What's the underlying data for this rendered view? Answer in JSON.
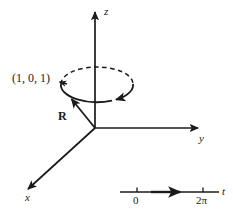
{
  "figure": {
    "background_color": "#ffffff",
    "stroke_color": "#1a1a1a",
    "axes": [
      {
        "name": "z",
        "label": "z",
        "direction": "up",
        "arrow": true
      },
      {
        "name": "y",
        "label": "y",
        "direction": "right",
        "arrow": true
      },
      {
        "name": "x",
        "label": "x",
        "direction": "down-left",
        "arrow": true
      }
    ],
    "origin": {
      "x": 95,
      "y": 128
    },
    "curve": {
      "name": "circular-orbit",
      "shape": "ellipse",
      "center": {
        "x": 97,
        "y": 84
      },
      "radius_x": 36,
      "radius_y": 17,
      "upper_half_style": "dashed",
      "lower_half_style": "solid",
      "direction_arrow": "counterclockwise-front-leftward"
    },
    "point_label": "(1, 0, 1)",
    "vector_label": "R",
    "t_axis": {
      "name": "parameter-axis",
      "label": "t",
      "arrow": true,
      "line": {
        "x1": 120,
        "x2": 220,
        "y": 192
      },
      "ticks": [
        {
          "label": "0",
          "x": 137
        },
        {
          "label": "2π",
          "x": 203
        }
      ]
    }
  }
}
